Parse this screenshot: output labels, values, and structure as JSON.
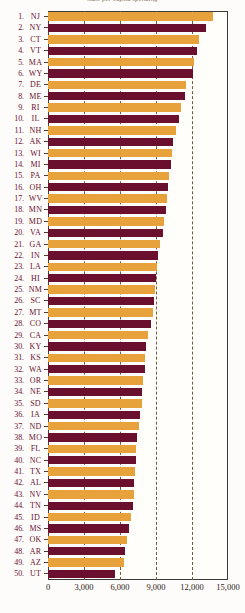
{
  "chart_data": {
    "type": "bar",
    "orientation": "horizontal",
    "title": "state per capita spending",
    "xlabel": "",
    "ylabel": "",
    "xlim": [
      0,
      15000
    ],
    "xticks": [
      0,
      3000,
      6000,
      9000,
      12000,
      15000
    ],
    "xticklabels": [
      "0",
      "3,000",
      "6,000",
      "9,000",
      "12,000",
      "15,000"
    ],
    "grid": true,
    "gridlines": [
      3000,
      6000,
      9000,
      12000
    ],
    "legend": "none",
    "colors": {
      "alternate_a": "#E8A23C",
      "alternate_b": "#6B0F2E",
      "label_text": "#6B1230",
      "axis": "#3A3A3A",
      "grid": "#6E5A3C",
      "background": "#FFFEFB"
    },
    "categories": [
      "NJ",
      "NY",
      "CT",
      "VT",
      "MA",
      "WY",
      "DE",
      "ME",
      "RI",
      "IL",
      "NH",
      "AK",
      "WI",
      "MI",
      "PA",
      "OH",
      "WV",
      "MN",
      "MD",
      "VA",
      "GA",
      "IN",
      "LA",
      "HI",
      "NM",
      "SC",
      "MT",
      "CO",
      "CA",
      "KY",
      "KS",
      "WA",
      "OR",
      "NE",
      "SD",
      "IA",
      "ND",
      "MO",
      "FL",
      "NC",
      "TX",
      "AL",
      "NV",
      "TN",
      "ID",
      "MS",
      "OK",
      "AR",
      "AZ",
      "UT"
    ],
    "ranks": [
      1,
      2,
      3,
      4,
      5,
      6,
      7,
      8,
      9,
      10,
      11,
      12,
      13,
      14,
      15,
      16,
      17,
      18,
      19,
      20,
      21,
      22,
      23,
      24,
      25,
      26,
      27,
      28,
      29,
      30,
      31,
      32,
      33,
      34,
      35,
      36,
      37,
      38,
      39,
      40,
      41,
      42,
      43,
      44,
      45,
      46,
      47,
      48,
      49,
      50
    ],
    "values": [
      13750,
      13200,
      12600,
      12450,
      12200,
      12050,
      11500,
      11450,
      11050,
      10900,
      10700,
      10450,
      10350,
      10250,
      10100,
      10000,
      9900,
      9800,
      9700,
      9600,
      9300,
      9150,
      9050,
      9000,
      8950,
      8850,
      8750,
      8600,
      8300,
      8200,
      8100,
      8050,
      7900,
      7850,
      7800,
      7700,
      7600,
      7450,
      7350,
      7300,
      7250,
      7200,
      7150,
      7050,
      6900,
      6750,
      6600,
      6450,
      6300,
      5600
    ],
    "bar_color_pattern": [
      "orange",
      "maroon"
    ]
  }
}
